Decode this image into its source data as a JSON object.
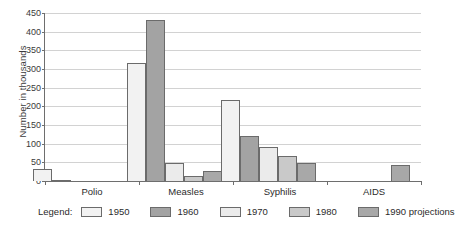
{
  "chart_data": {
    "type": "bar",
    "title": "",
    "subtitle": "",
    "xlabel": "",
    "ylabel": "Number in thousands",
    "ylim": [
      0,
      450
    ],
    "yticks": [
      0,
      50,
      100,
      150,
      200,
      250,
      300,
      350,
      400,
      450
    ],
    "grid": true,
    "legend_position": "bottom",
    "legend_title": "Legend:",
    "categories": [
      "Polio",
      "Measles",
      "Syphilis",
      "AIDS"
    ],
    "series": [
      {
        "name": "1950",
        "color": "#f2f2f2",
        "values": [
          33,
          317,
          217,
          0
        ]
      },
      {
        "name": "1960",
        "color": "#a3a3a3",
        "values": [
          3,
          430,
          120,
          0
        ]
      },
      {
        "name": "1970",
        "color": "#ebebeb",
        "values": [
          0,
          47,
          92,
          0
        ]
      },
      {
        "name": "1980",
        "color": "#c9c9c9",
        "values": [
          0,
          13,
          68,
          0
        ]
      },
      {
        "name": "1990 projections",
        "color": "#a8a8a8",
        "values": [
          0,
          27,
          48,
          43
        ]
      }
    ]
  },
  "style": {
    "axis_color": "#6e6e6e",
    "grid_color": "#d2d2d2",
    "bar_border_color": "#6b6b6b",
    "text_color": "#2b2b2b",
    "background": "#ffffff"
  }
}
